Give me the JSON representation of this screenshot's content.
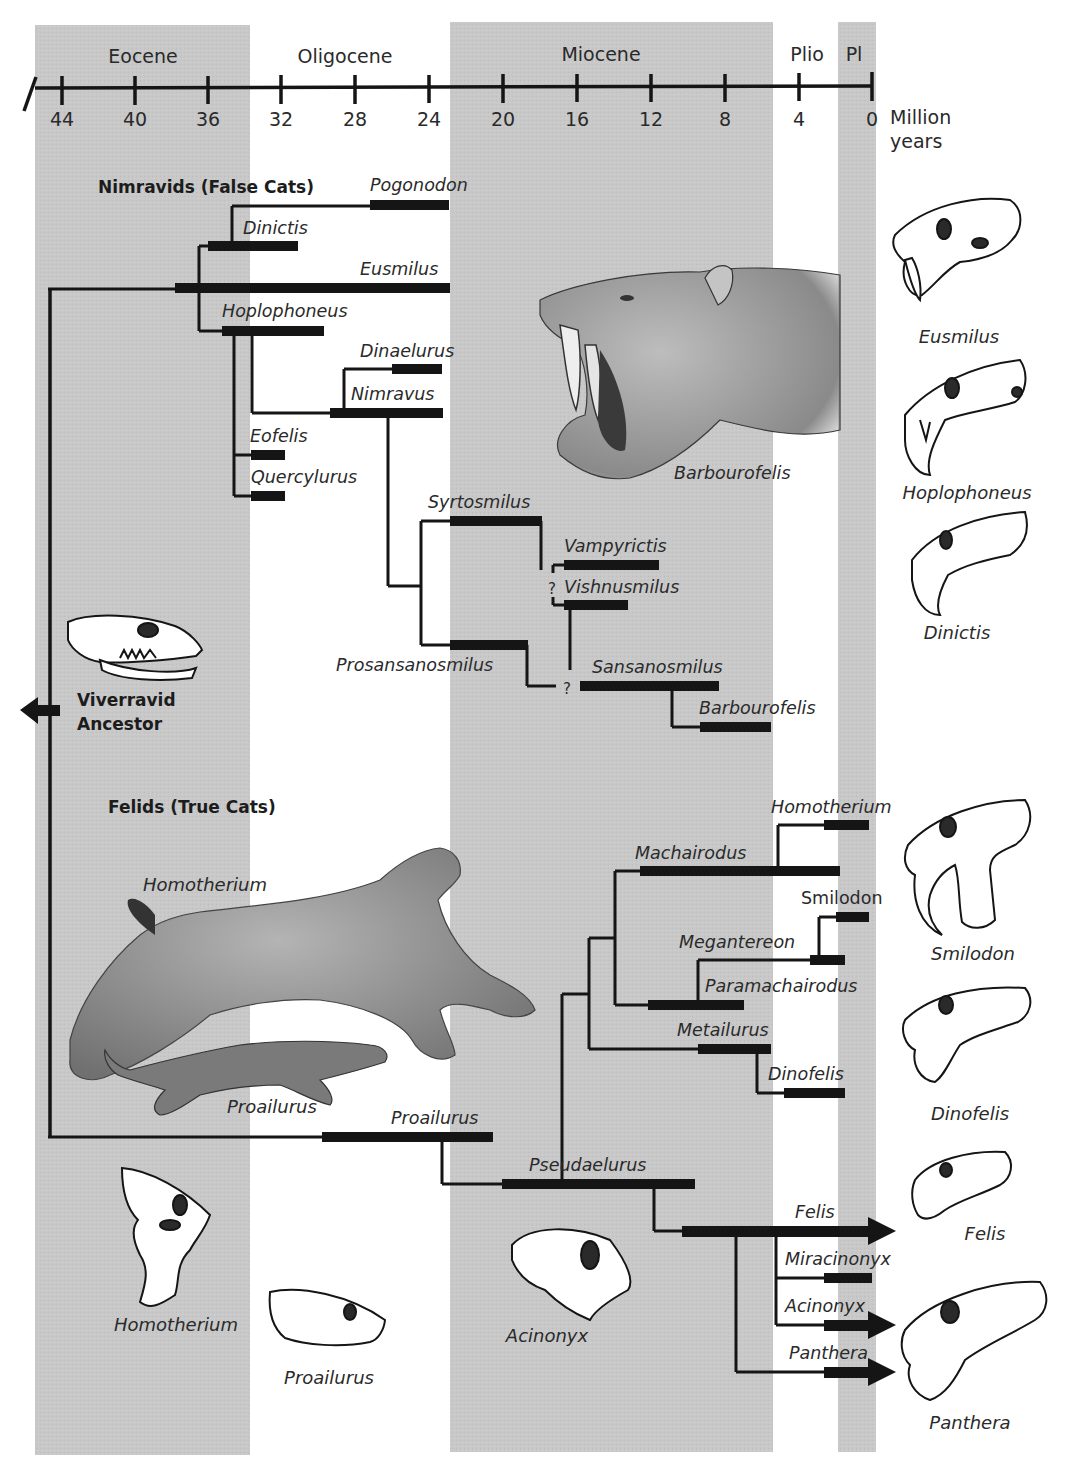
{
  "colors": {
    "band": "#c9c9c9",
    "ink": "#151515",
    "animal_fill": "#9a9a9a",
    "animal_shade": "#7a7a7a",
    "skull_fill": "#ffffff"
  },
  "axis": {
    "unit_line1": "Million",
    "unit_line2": "years",
    "ticks": [
      {
        "label": "44",
        "x": 62
      },
      {
        "label": "40",
        "x": 135
      },
      {
        "label": "36",
        "x": 208
      },
      {
        "label": "32",
        "x": 281
      },
      {
        "label": "28",
        "x": 355
      },
      {
        "label": "24",
        "x": 429
      },
      {
        "label": "20",
        "x": 503
      },
      {
        "label": "16",
        "x": 577
      },
      {
        "label": "12",
        "x": 651
      },
      {
        "label": "8",
        "x": 725
      },
      {
        "label": "4",
        "x": 799
      },
      {
        "label": "0",
        "x": 872
      }
    ]
  },
  "epochs": [
    {
      "name": "Eocene",
      "x0": 35,
      "x1": 250,
      "shaded": true,
      "label_x": 143
    },
    {
      "name": "Oligocene",
      "x0": 250,
      "x1": 450,
      "shaded": false,
      "label_x": 345
    },
    {
      "name": "Miocene",
      "x0": 450,
      "x1": 773,
      "shaded": true,
      "label_x": 601
    },
    {
      "name": "Plio",
      "x0": 773,
      "x1": 838,
      "shaded": false,
      "label_x": 807
    },
    {
      "name": "Pl",
      "x0": 838,
      "x1": 876,
      "shaded": true,
      "label_x": 854
    }
  ],
  "groups": {
    "nimravids": "Nimravids (False Cats)",
    "felids": "Felids (True Cats)",
    "ancestor_line1": "Viverravid",
    "ancestor_line2": "Ancestor"
  },
  "taxa": {
    "pogonodon": "Pogonodon",
    "dinictis": "Dinictis",
    "eusmilus": "Eusmilus",
    "hoplophoneus": "Hoplophoneus",
    "dinaelurus": "Dinaelurus",
    "nimravus": "Nimravus",
    "eofelis": "Eofelis",
    "quercylurus": "Quercylurus",
    "syrtosmilus": "Syrtosmilus",
    "vampyrictis": "Vampyrictis",
    "vishnusmilus": "Vishnusmilus",
    "prosansanosmilus": "Prosansanosmilus",
    "sansanosmilus": "Sansanosmilus",
    "barbourofelis": "Barbourofelis",
    "homotherium": "Homotherium",
    "machairodus": "Machairodus",
    "smilodon": "Smilodon",
    "megantereon": "Megantereon",
    "paramachairodus": "Paramachairodus",
    "metailurus": "Metailurus",
    "dinofelis": "Dinofelis",
    "proailurus": "Proailurus",
    "pseudaelurus": "Pseudaelurus",
    "felis": "Felis",
    "miracinonyx": "Miracinonyx",
    "acinonyx": "Acinonyx",
    "panthera": "Panthera"
  },
  "uncertain_mark": "?",
  "illustrations": {
    "barbourofelis_head": "Barbourofelis",
    "homotherium_body": "Homotherium",
    "proailurus_body": "Proailurus"
  },
  "skull_captions": {
    "eusmilus": "Eusmilus",
    "hoplophoneus": "Hoplophoneus",
    "dinictis": "Dinictis",
    "smilodon": "Smilodon",
    "dinofelis": "Dinofelis",
    "felis": "Felis",
    "panthera": "Panthera",
    "homotherium": "Homotherium",
    "proailurus": "Proailurus",
    "acinonyx": "Acinonyx"
  }
}
